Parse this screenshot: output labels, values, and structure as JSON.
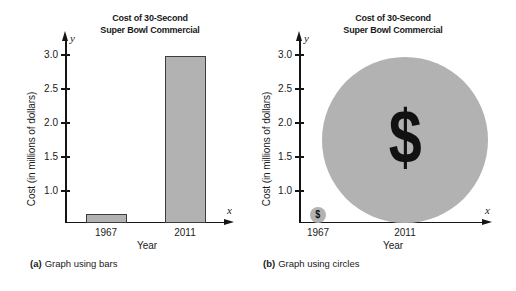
{
  "figure": {
    "background": "#ffffff",
    "text_color": "#1a1a1a",
    "axis_color": "#151515",
    "gray_fill": "#b2b2b2"
  },
  "chart_data": [
    {
      "type": "bar",
      "panel": "a",
      "title": "Cost of 30-Second Super Bowl Commercial",
      "title_lines": [
        "Cost of 30-Second",
        "Super Bowl Commercial"
      ],
      "categories": [
        "1967",
        "2011"
      ],
      "values": [
        0.15,
        3.0
      ],
      "unit": "millions of dollars",
      "xlabel": "Year",
      "ylabel": "Cost (in millions of dollars)",
      "yticks": [
        "3.0",
        "2.5",
        "2.0",
        "1.5",
        "1.0"
      ],
      "ylim_shown": [
        1.0,
        3.0
      ],
      "grid": false,
      "axis_letters": {
        "x": "x",
        "y": "y"
      },
      "caption": {
        "label": "(a)",
        "text": "Graph using bars"
      },
      "bar_color": "#b2b2b2",
      "bar_border_color": "#3d3d3d",
      "drawn_heights_px": [
        9,
        167
      ]
    },
    {
      "type": "circle",
      "panel": "b",
      "title": "Cost of 30-Second Super Bowl Commercial",
      "title_lines": [
        "Cost of 30-Second",
        "Super Bowl Commercial"
      ],
      "categories": [
        "1967",
        "2011"
      ],
      "values": [
        0.04,
        3.0
      ],
      "unit": "millions of dollars",
      "xlabel": "Year",
      "ylabel": "Cost (in millions of dollars)",
      "yticks": [
        "3.0",
        "2.5",
        "2.0",
        "1.5",
        "1.0"
      ],
      "ylim_shown": [
        1.0,
        3.0
      ],
      "grid": false,
      "axis_letters": {
        "x": "x",
        "y": "y"
      },
      "caption": {
        "label": "(b)",
        "text": "Graph using circles"
      },
      "circle_color": "#b2b2b2",
      "symbol": "$",
      "symbol_color": "#111111",
      "drawn_radii_px": [
        8,
        83
      ]
    }
  ]
}
